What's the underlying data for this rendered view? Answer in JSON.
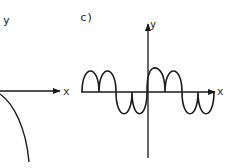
{
  "panels": [
    {
      "id": "b-partial",
      "y_label": "y",
      "x_label": "x",
      "curve": "concave-down arc descending from the origin (partially cropped on left)"
    },
    {
      "id": "c",
      "panel_label": "c)",
      "y_label": "y",
      "x_label": "x",
      "curve": "full-wave rectified-like wave: two humps above the x-axis, two dips below, repeating; passes through origin"
    }
  ],
  "colors": {
    "stroke": "#1a1a1a",
    "background": "#ffffff"
  }
}
